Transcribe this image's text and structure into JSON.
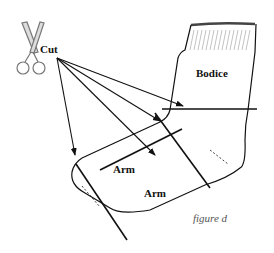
{
  "diagram": {
    "labels": {
      "cut": "Cut",
      "bodice": "Bodice",
      "arm_upper": "Arm",
      "arm_lower": "Arm",
      "caption": "figure d"
    },
    "icons": {
      "scissors": "scissors-icon"
    },
    "colors": {
      "line": "#111111",
      "caption": "#555555",
      "scissors_fill": "#dddddd",
      "scissors_stroke": "#777777",
      "background": "#ffffff"
    }
  }
}
